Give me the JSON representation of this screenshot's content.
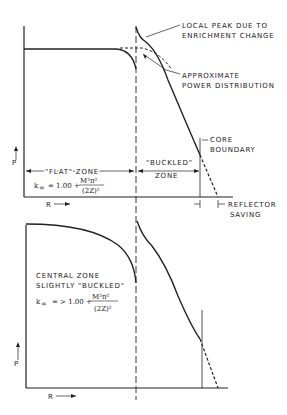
{
  "top_chart": {
    "y_axis_label": "P",
    "x_axis_label": "R",
    "annotations": {
      "local_peak_1": "LOCAL PEAK DUE TO",
      "local_peak_2": "ENRICHMENT CHANGE",
      "approx_1": "APPROXIMATE",
      "approx_2": "POWER DISTRIBUTION",
      "core_1": "CORE",
      "core_2": "BOUNDARY",
      "reflector_1": "REFLECTOR",
      "reflector_2": "SAVING",
      "flat_zone": "\"FLAT\" ZONE",
      "buckled_1": "\"BUCKLED\"",
      "buckled_2": "ZONE"
    },
    "formula": {
      "lhs": "k",
      "sub": "∞",
      "rhs": "= 1.00 +",
      "num": "M²π²",
      "den": "(2Z)²"
    }
  },
  "bottom_chart": {
    "y_axis_label": "P",
    "x_axis_label": "R",
    "annotations": {
      "central_1": "CENTRAL ZONE",
      "central_2": "SLIGHTLY \"BUCKLED\""
    },
    "formula": {
      "lhs": "k",
      "sub": "∞",
      "rhs": "= > 1.00 +",
      "num": "M²π²",
      "den": "(2Z)²"
    }
  }
}
